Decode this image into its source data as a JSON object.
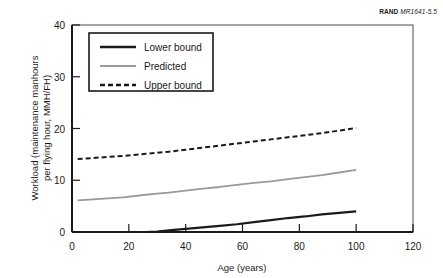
{
  "credit": {
    "brand": "RAND",
    "document_id": "MR1641-5.5"
  },
  "chart_data": {
    "type": "line",
    "title": "",
    "xlabel": "Age (years)",
    "ylabel": "Workload (maintenance manhours per flying hour, MMH/FH)",
    "xlim": [
      0,
      120
    ],
    "ylim": [
      0,
      40
    ],
    "xticks": [
      0,
      20,
      40,
      60,
      80,
      100,
      120
    ],
    "yticks": [
      0,
      10,
      20,
      30,
      40
    ],
    "grid": false,
    "legend_position": "upper-left",
    "x": [
      2,
      10,
      18,
      26,
      30,
      34,
      40,
      46,
      52,
      58,
      64,
      70,
      76,
      82,
      88,
      94,
      100
    ],
    "series": [
      {
        "name": "Lower bound",
        "style": "solid",
        "color": "#1a1a1a",
        "width": 2.2,
        "values": [
          0,
          0,
          0,
          0,
          0.1,
          0.3,
          0.6,
          0.9,
          1.2,
          1.5,
          1.9,
          2.3,
          2.7,
          3.0,
          3.4,
          3.7,
          4.0
        ]
      },
      {
        "name": "Predicted",
        "style": "solid",
        "color": "#9a9a9a",
        "width": 1.8,
        "values": [
          6.1,
          6.4,
          6.7,
          7.2,
          7.4,
          7.6,
          8.0,
          8.4,
          8.7,
          9.1,
          9.5,
          9.8,
          10.2,
          10.6,
          11.0,
          11.5,
          12.0
        ]
      },
      {
        "name": "Upper bound",
        "style": "dashed",
        "color": "#1a1a1a",
        "width": 2.0,
        "values": [
          14.1,
          14.4,
          14.7,
          15.1,
          15.3,
          15.5,
          15.9,
          16.3,
          16.7,
          17.1,
          17.5,
          17.9,
          18.3,
          18.7,
          19.1,
          19.6,
          20.1
        ]
      }
    ]
  },
  "legend": {
    "items": [
      {
        "label": "Lower bound"
      },
      {
        "label": "Predicted"
      },
      {
        "label": "Upper bound"
      }
    ]
  }
}
